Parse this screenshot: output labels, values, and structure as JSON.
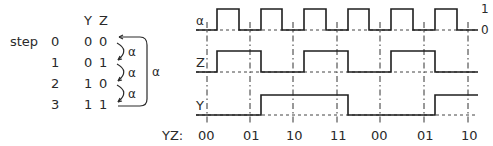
{
  "table": {
    "step_label": "step",
    "headers": {
      "y": "Y",
      "z": "Z"
    },
    "rows": [
      {
        "step": "0",
        "y": "0",
        "z": "0"
      },
      {
        "step": "1",
        "y": "0",
        "z": "1"
      },
      {
        "step": "2",
        "y": "1",
        "z": "0"
      },
      {
        "step": "3",
        "y": "1",
        "z": "1"
      }
    ],
    "transition_label": "α",
    "wrap_label": "α"
  },
  "timing": {
    "signals": [
      {
        "name": "α",
        "levels": [
          0,
          1,
          0,
          1,
          0,
          1,
          0,
          1,
          0,
          1,
          0,
          1,
          0,
          1
        ]
      },
      {
        "name": "Z",
        "levels": [
          0,
          1,
          1,
          0,
          0,
          1,
          1,
          0,
          0,
          1,
          1,
          0,
          0
        ]
      },
      {
        "name": "Y",
        "levels": [
          0,
          0,
          0,
          1,
          1,
          1,
          1,
          0,
          0,
          0,
          0,
          1,
          1
        ]
      }
    ],
    "level_labels": {
      "high": "1",
      "low": "0"
    },
    "axis_label": "YZ:",
    "states": [
      "00",
      "01",
      "10",
      "11",
      "00",
      "01",
      "10"
    ],
    "edges_x": [
      217,
      239,
      261,
      282,
      304,
      326,
      348,
      369,
      391,
      413,
      435,
      457
    ],
    "marker_x": [
      207,
      250,
      293,
      337,
      380,
      424,
      468
    ]
  }
}
